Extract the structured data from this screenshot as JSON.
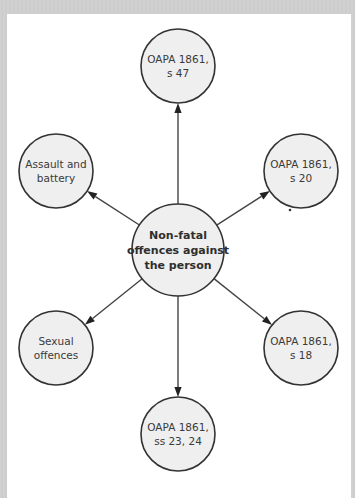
{
  "diagram": {
    "colors": {
      "node_fill": "#efefef",
      "node_stroke": "#333333",
      "edge": "#444444",
      "background": "#ffffff",
      "frame": "#cfcfcf"
    },
    "center": {
      "id": "center",
      "lines": [
        "Non-fatal",
        "offences against",
        "the person"
      ]
    },
    "nodes": [
      {
        "id": "s47",
        "direction": "top",
        "lines": [
          "OAPA 1861,",
          "s 47"
        ]
      },
      {
        "id": "assault",
        "direction": "upper-left",
        "lines": [
          "Assault and",
          "battery"
        ]
      },
      {
        "id": "s20",
        "direction": "upper-right",
        "lines": [
          "OAPA 1861,",
          "s 20"
        ]
      },
      {
        "id": "sexual",
        "direction": "lower-left",
        "lines": [
          "Sexual",
          "offences"
        ]
      },
      {
        "id": "s18",
        "direction": "lower-right",
        "lines": [
          "OAPA 1861,",
          "s 18"
        ]
      },
      {
        "id": "s2324",
        "direction": "bottom",
        "lines": [
          "OAPA 1861,",
          "ss 23, 24"
        ]
      }
    ],
    "edges": [
      {
        "from": "center",
        "to": "s47"
      },
      {
        "from": "center",
        "to": "assault"
      },
      {
        "from": "center",
        "to": "s20"
      },
      {
        "from": "center",
        "to": "sexual"
      },
      {
        "from": "center",
        "to": "s18"
      },
      {
        "from": "center",
        "to": "s2324"
      }
    ]
  }
}
